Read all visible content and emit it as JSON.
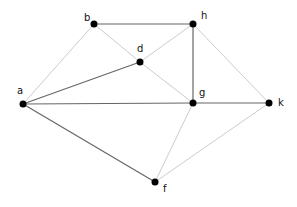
{
  "graph": {
    "nodes": [
      {
        "id": "a",
        "label": "a",
        "x": 23,
        "y": 104,
        "lx": 17,
        "ly": 86
      },
      {
        "id": "b",
        "label": "b",
        "x": 94,
        "y": 24,
        "lx": 84,
        "ly": 13
      },
      {
        "id": "h",
        "label": "h",
        "x": 193,
        "y": 24,
        "lx": 201,
        "ly": 11
      },
      {
        "id": "d",
        "label": "d",
        "x": 140,
        "y": 62,
        "lx": 137,
        "ly": 44
      },
      {
        "id": "g",
        "label": "g",
        "x": 193,
        "y": 103,
        "lx": 199,
        "ly": 88
      },
      {
        "id": "k",
        "label": "k",
        "x": 269,
        "y": 103,
        "lx": 278,
        "ly": 98
      },
      {
        "id": "f",
        "label": "f",
        "x": 155,
        "y": 182,
        "lx": 163,
        "ly": 184
      }
    ],
    "edges": [
      {
        "from": "b",
        "to": "h",
        "style": "dark"
      },
      {
        "from": "h",
        "to": "g",
        "style": "dark"
      },
      {
        "from": "a",
        "to": "d",
        "style": "dark"
      },
      {
        "from": "a",
        "to": "g",
        "style": "dark"
      },
      {
        "from": "g",
        "to": "k",
        "style": "dark"
      },
      {
        "from": "a",
        "to": "f",
        "style": "dark"
      },
      {
        "from": "a",
        "to": "b",
        "style": "light"
      },
      {
        "from": "b",
        "to": "d",
        "style": "light"
      },
      {
        "from": "d",
        "to": "g",
        "style": "light"
      },
      {
        "from": "d",
        "to": "h",
        "style": "light"
      },
      {
        "from": "h",
        "to": "k",
        "style": "light"
      },
      {
        "from": "g",
        "to": "f",
        "style": "light"
      },
      {
        "from": "f",
        "to": "k",
        "style": "light"
      }
    ],
    "colors": {
      "dark": "#666666",
      "light": "#cccccc",
      "node": "#000000"
    }
  }
}
